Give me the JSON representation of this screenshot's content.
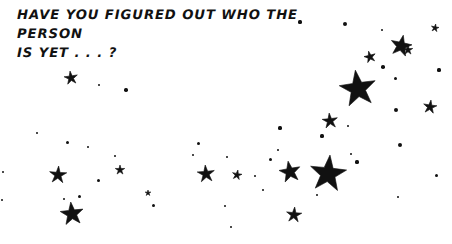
{
  "image": {
    "width": 452,
    "height": 244,
    "background_color": "#ffffff",
    "ink_color": "#111111"
  },
  "caption": {
    "line1": "HAVE YOU FIGURED OUT WHO THE PERSON",
    "line2": "IS YET . . . ?",
    "full_text": "HAVE YOU FIGURED OUT WHO THE PERSON\nIS YET . . . ?"
  },
  "starfield": {
    "description": "Hand-drawn black five-pointed stars scattered on a white field, densest toward the upper-right and sweeping down to the lower-left.",
    "star_color": "#111111",
    "stars": [
      {
        "name": "star-large-upper-right",
        "x": 358,
        "y": 89,
        "r": 19,
        "rot": -8,
        "kind": "star"
      },
      {
        "name": "star-large-center-right",
        "x": 328,
        "y": 174,
        "r": 19,
        "rot": 6,
        "kind": "star"
      },
      {
        "name": "star-medium-top-right",
        "x": 401,
        "y": 46,
        "r": 11,
        "rot": 12,
        "kind": "star"
      },
      {
        "name": "star-medium-top-far-right",
        "x": 370,
        "y": 57,
        "r": 6,
        "rot": -14,
        "kind": "star"
      },
      {
        "name": "star-small-top-right-edge",
        "x": 435,
        "y": 28,
        "r": 4,
        "rot": 10,
        "kind": "star"
      },
      {
        "name": "star-medium-mid-right",
        "x": 330,
        "y": 121,
        "r": 8,
        "rot": -6,
        "kind": "star"
      },
      {
        "name": "star-small-right-edge",
        "x": 430,
        "y": 107,
        "r": 7,
        "rot": 8,
        "kind": "star"
      },
      {
        "name": "star-medium-lower-right",
        "x": 408,
        "y": 50,
        "r": 5,
        "rot": 0,
        "kind": "star"
      },
      {
        "name": "star-medium-center",
        "x": 290,
        "y": 172,
        "r": 11,
        "rot": -10,
        "kind": "star"
      },
      {
        "name": "star-medium-lower-center",
        "x": 294,
        "y": 215,
        "r": 8,
        "rot": 5,
        "kind": "star"
      },
      {
        "name": "star-medium-mid-left",
        "x": 206,
        "y": 174,
        "r": 9,
        "rot": -5,
        "kind": "star"
      },
      {
        "name": "star-small-mid-left",
        "x": 237,
        "y": 175,
        "r": 5,
        "rot": 10,
        "kind": "star"
      },
      {
        "name": "star-small-upper-left",
        "x": 71,
        "y": 78,
        "r": 7,
        "rot": -8,
        "kind": "star"
      },
      {
        "name": "star-medium-left",
        "x": 58,
        "y": 175,
        "r": 9,
        "rot": 4,
        "kind": "star"
      },
      {
        "name": "star-medium-bottom-left",
        "x": 72,
        "y": 214,
        "r": 12,
        "rot": -6,
        "kind": "star"
      },
      {
        "name": "star-small-bottom-left",
        "x": 120,
        "y": 170,
        "r": 5,
        "rot": 0,
        "kind": "star"
      },
      {
        "name": "star-small-left-lower",
        "x": 148,
        "y": 193,
        "r": 3,
        "rot": 0,
        "kind": "star"
      },
      {
        "name": "dot-top-right-a",
        "x": 345,
        "y": 24,
        "r": 2.0,
        "kind": "dot"
      },
      {
        "name": "dot-top-right-b",
        "x": 382,
        "y": 30,
        "r": 1.4,
        "kind": "dot"
      },
      {
        "name": "dot-top-right-c",
        "x": 300,
        "y": 22,
        "r": 1.6,
        "kind": "dot"
      },
      {
        "name": "dot-upper-right-a",
        "x": 383,
        "y": 67,
        "r": 1.8,
        "kind": "dot"
      },
      {
        "name": "dot-upper-right-b",
        "x": 395,
        "y": 78,
        "r": 1.5,
        "kind": "dot"
      },
      {
        "name": "dot-upper-right-c",
        "x": 439,
        "y": 70,
        "r": 1.6,
        "kind": "dot"
      },
      {
        "name": "dot-right-a",
        "x": 396,
        "y": 110,
        "r": 2.0,
        "kind": "dot"
      },
      {
        "name": "dot-right-b",
        "x": 400,
        "y": 145,
        "r": 2.0,
        "kind": "dot"
      },
      {
        "name": "dot-right-c",
        "x": 398,
        "y": 197,
        "r": 1.4,
        "kind": "dot"
      },
      {
        "name": "dot-right-d",
        "x": 436,
        "y": 175,
        "r": 1.5,
        "kind": "dot"
      },
      {
        "name": "dot-center-a",
        "x": 322,
        "y": 136,
        "r": 1.6,
        "kind": "dot"
      },
      {
        "name": "dot-center-b",
        "x": 348,
        "y": 126,
        "r": 1.4,
        "kind": "dot"
      },
      {
        "name": "dot-center-c",
        "x": 357,
        "y": 162,
        "r": 1.6,
        "kind": "dot"
      },
      {
        "name": "dot-center-d",
        "x": 351,
        "y": 154,
        "r": 1.4,
        "kind": "dot"
      },
      {
        "name": "dot-center-e",
        "x": 280,
        "y": 128,
        "r": 1.6,
        "kind": "dot"
      },
      {
        "name": "dot-center-f",
        "x": 278,
        "y": 150,
        "r": 1.3,
        "kind": "dot"
      },
      {
        "name": "dot-center-g",
        "x": 317,
        "y": 195,
        "r": 1.4,
        "kind": "dot"
      },
      {
        "name": "dot-center-h",
        "x": 270,
        "y": 159,
        "r": 1.5,
        "kind": "dot"
      },
      {
        "name": "dot-center-i",
        "x": 263,
        "y": 190,
        "r": 1.3,
        "kind": "dot"
      },
      {
        "name": "dot-mid-left-a",
        "x": 198,
        "y": 143,
        "r": 1.5,
        "kind": "dot"
      },
      {
        "name": "dot-mid-left-b",
        "x": 193,
        "y": 155,
        "r": 1.3,
        "kind": "dot"
      },
      {
        "name": "dot-mid-left-c",
        "x": 227,
        "y": 157,
        "r": 1.3,
        "kind": "dot"
      },
      {
        "name": "dot-mid-left-d",
        "x": 255,
        "y": 176,
        "r": 1.4,
        "kind": "dot"
      },
      {
        "name": "dot-mid-left-e",
        "x": 153,
        "y": 205,
        "r": 1.5,
        "kind": "dot"
      },
      {
        "name": "dot-mid-left-f",
        "x": 225,
        "y": 206,
        "r": 1.4,
        "kind": "dot"
      },
      {
        "name": "dot-mid-left-g",
        "x": 231,
        "y": 227,
        "r": 1.3,
        "kind": "dot"
      },
      {
        "name": "dot-left-a",
        "x": 79,
        "y": 196,
        "r": 1.5,
        "kind": "dot"
      },
      {
        "name": "dot-left-b",
        "x": 88,
        "y": 147,
        "r": 1.4,
        "kind": "dot"
      },
      {
        "name": "dot-left-c",
        "x": 126,
        "y": 90,
        "r": 1.7,
        "kind": "dot"
      },
      {
        "name": "dot-left-d",
        "x": 99,
        "y": 85,
        "r": 1.2,
        "kind": "dot"
      },
      {
        "name": "dot-left-e",
        "x": 67,
        "y": 142,
        "r": 1.5,
        "kind": "dot"
      },
      {
        "name": "dot-left-f",
        "x": 37,
        "y": 133,
        "r": 1.4,
        "kind": "dot"
      },
      {
        "name": "dot-left-g",
        "x": 3,
        "y": 172,
        "r": 1.4,
        "kind": "dot"
      },
      {
        "name": "dot-left-h",
        "x": 2,
        "y": 200,
        "r": 1.3,
        "kind": "dot"
      },
      {
        "name": "dot-bottom-left-a",
        "x": 98,
        "y": 180,
        "r": 1.5,
        "kind": "dot"
      },
      {
        "name": "dot-bottom-left-b",
        "x": 64,
        "y": 199,
        "r": 1.4,
        "kind": "dot"
      },
      {
        "name": "dot-bottom-left-c",
        "x": 115,
        "y": 156,
        "r": 1.4,
        "kind": "dot"
      }
    ]
  }
}
